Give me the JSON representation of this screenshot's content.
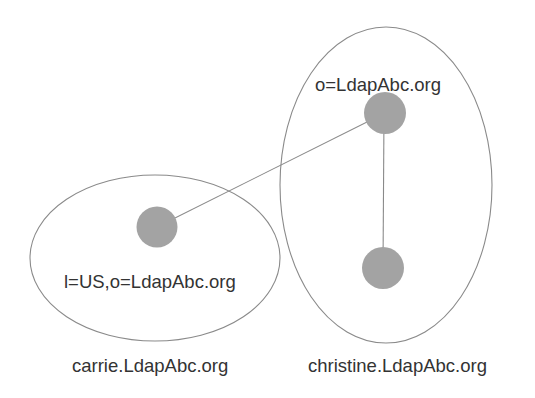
{
  "diagram": {
    "type": "ldap-directory-partition",
    "colors": {
      "background": "#ffffff",
      "node_fill": "#a3a3a3",
      "stroke": "#8a8a8a",
      "text": "#333333"
    },
    "domains": [
      {
        "id": "carrie",
        "label": "carrie.LdapAbc.org"
      },
      {
        "id": "christine",
        "label": "christine.LdapAbc.org"
      }
    ],
    "nodes": [
      {
        "id": "root",
        "domain": "christine",
        "label": "o=LdapAbc.org"
      },
      {
        "id": "us",
        "domain": "carrie",
        "label": "l=US,o=LdapAbc.org"
      },
      {
        "id": "child",
        "domain": "christine",
        "label": ""
      }
    ],
    "edges": [
      {
        "from": "root",
        "to": "us"
      },
      {
        "from": "root",
        "to": "child"
      }
    ]
  }
}
